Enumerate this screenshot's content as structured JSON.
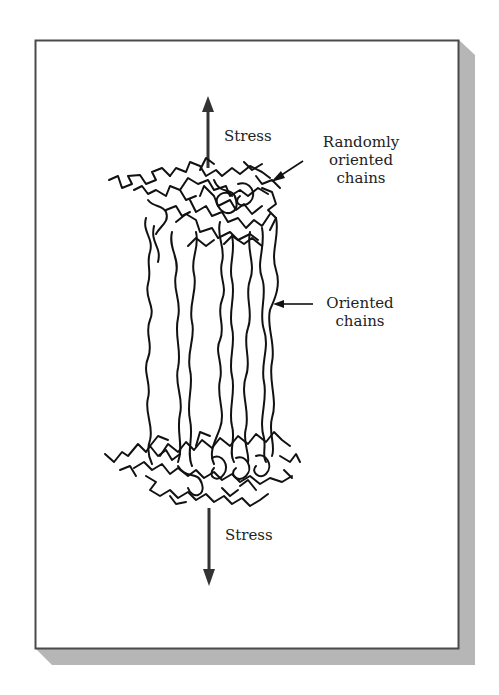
{
  "figure": {
    "colors": {
      "frame": "#4a4a4a",
      "shadow": "#b4b4b4",
      "ink": "#111111",
      "text": "#222222",
      "background": "#ffffff"
    }
  },
  "labels": {
    "stress_top": "Stress",
    "stress_bottom": "Stress",
    "random_line1": "Randomly",
    "random_line2": "oriented",
    "random_line3": "chains",
    "oriented_line1": "Oriented",
    "oriented_line2": "chains"
  },
  "arrows": {
    "stress_top": {
      "direction": "up"
    },
    "stress_bottom": {
      "direction": "down"
    },
    "random_pointer": {
      "direction": "down-left"
    },
    "oriented_pointer": {
      "direction": "left"
    }
  }
}
